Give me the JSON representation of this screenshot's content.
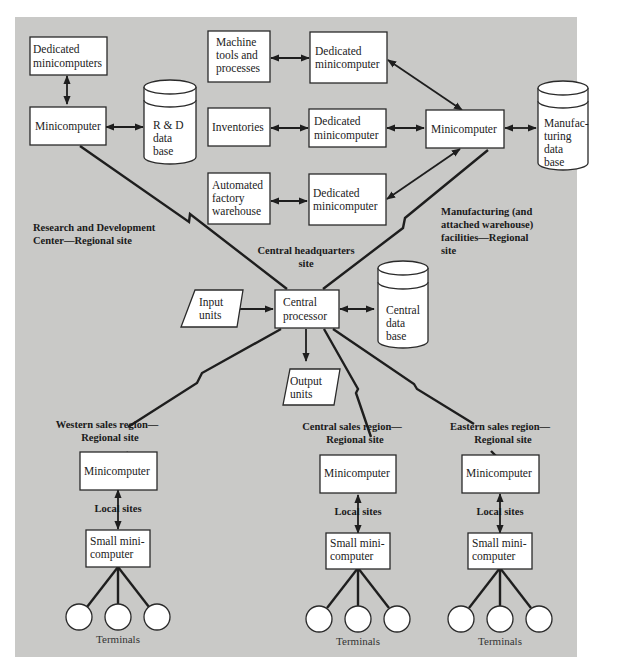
{
  "diagram": {
    "colors": {
      "panel": "#c9c9c7",
      "box": "#ffffff",
      "stroke": "#1e1e1e",
      "text": "#222222"
    },
    "rd_site": {
      "region_label": [
        "Research and Development",
        "Center—Regional site"
      ],
      "dedicated": [
        "Dedicated",
        "minicomputers"
      ],
      "minicomputer": [
        "Minicomputer"
      ],
      "database": [
        "R & D",
        "data",
        "base"
      ]
    },
    "manufacturing_site": {
      "region_label": [
        "Manufacturing (and",
        "attached warehouse)",
        "facilities—Regional",
        "site"
      ],
      "sources": [
        {
          "label": [
            "Machine",
            "tools and",
            "processes"
          ],
          "dedicated": [
            "Dedicated",
            "minicomputer"
          ]
        },
        {
          "label": [
            "Inventories"
          ],
          "dedicated": [
            "Dedicated",
            "minicomputer"
          ]
        },
        {
          "label": [
            "Automated",
            "factory",
            "warehouse"
          ],
          "dedicated": [
            "Dedicated",
            "minicomputer"
          ]
        }
      ],
      "minicomputer": [
        "Minicomputer"
      ],
      "database": [
        "Manufac-",
        "turing",
        "data",
        "base"
      ]
    },
    "central_site": {
      "region_label": [
        "Central headquarters",
        "site"
      ],
      "processor": [
        "Central",
        "processor"
      ],
      "input": [
        "Input",
        "units"
      ],
      "output": [
        "Output",
        "units"
      ],
      "database": [
        "Central",
        "data",
        "base"
      ]
    },
    "sales_regions": [
      {
        "region_label": [
          "Western sales region—",
          "Regional site"
        ],
        "minicomputer": [
          "Minicomputer"
        ],
        "local_label": "Local sites",
        "small": [
          "Small mini-",
          "computer"
        ],
        "terminals_label": "Terminals",
        "terminal_count": 3
      },
      {
        "region_label": [
          "Central sales region—",
          "Regional site"
        ],
        "minicomputer": [
          "Minicomputer"
        ],
        "local_label": "Local sites",
        "small": [
          "Small mini-",
          "computer"
        ],
        "terminals_label": "Terminals",
        "terminal_count": 3
      },
      {
        "region_label": [
          "Eastern sales region—",
          "Regional site"
        ],
        "minicomputer": [
          "Minicomputer"
        ],
        "local_label": "Local sites",
        "small": [
          "Small mini-",
          "computer"
        ],
        "terminals_label": "Terminals",
        "terminal_count": 3
      }
    ]
  }
}
